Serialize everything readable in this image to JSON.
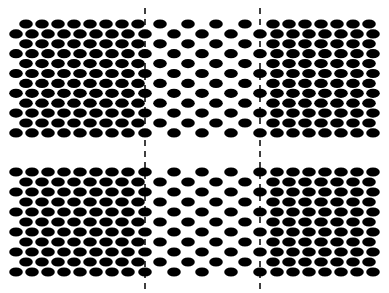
{
  "canvas": {
    "width": 389,
    "height": 293,
    "background": "#ffffff"
  },
  "style": {
    "dot_color": "#000000",
    "line_color": "#000000"
  },
  "dividers": [
    {
      "name": "left-dashed-divider",
      "x": 145,
      "y1": 8,
      "y2": 291
    },
    {
      "name": "right-dashed-divider",
      "x": 260,
      "y1": 8,
      "y2": 291
    }
  ],
  "panels": [
    {
      "name": "top-panel",
      "row_y_start": 24,
      "row_spacing": 9.9,
      "rows": 12,
      "first_row_offset": "a",
      "dense": {
        "rx": 6.8,
        "ry": 4.6,
        "row_a_x": [
          26,
          42,
          58,
          74,
          90,
          106,
          122,
          138
        ],
        "row_b_x": [
          16,
          32,
          48,
          64,
          80,
          96,
          112,
          128,
          145
        ]
      },
      "sparse": {
        "rx": 6.8,
        "ry": 4.6,
        "row_a_x": [
          160,
          188,
          216,
          245
        ],
        "row_b_x": [
          174,
          202,
          231
        ]
      },
      "right": {
        "rx": 6.8,
        "ry": 4.6,
        "row_a_x": [
          273,
          289,
          305,
          321,
          337,
          353,
          369
        ],
        "row_b_x": [
          260,
          277,
          293,
          309,
          325,
          341,
          357,
          373
        ]
      }
    },
    {
      "name": "bottom-panel",
      "row_y_start": 172,
      "row_spacing": 10,
      "rows": 11,
      "first_row_offset": "b",
      "dense": {
        "rx": 6.8,
        "ry": 4.6,
        "row_a_x": [
          26,
          42,
          58,
          74,
          90,
          106,
          122,
          138
        ],
        "row_b_x": [
          16,
          32,
          48,
          64,
          80,
          96,
          112,
          128,
          145
        ]
      },
      "sparse": {
        "rx": 6.8,
        "ry": 4.6,
        "row_a_x": [
          160,
          188,
          216,
          245
        ],
        "row_b_x": [
          174,
          202,
          231
        ]
      },
      "right": {
        "rx": 6.8,
        "ry": 4.6,
        "row_a_x": [
          273,
          289,
          305,
          321,
          337,
          353,
          369
        ],
        "row_b_x": [
          260,
          277,
          293,
          309,
          325,
          341,
          357,
          373
        ]
      }
    }
  ]
}
